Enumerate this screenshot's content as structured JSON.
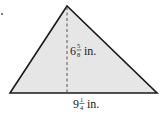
{
  "figure": {
    "shape": "triangle",
    "fill_color": "#e6e6e6",
    "stroke_color": "#1a1a1a",
    "vertices": {
      "apex": [
        67,
        6
      ],
      "base_left": [
        10,
        93
      ],
      "base_right": [
        157,
        93
      ]
    },
    "height": {
      "whole": "6",
      "numerator": "5",
      "denominator": "8",
      "unit": "in.",
      "style": "dashed"
    },
    "base": {
      "whole": "9",
      "numerator": "1",
      "denominator": "4",
      "unit": "in."
    }
  }
}
